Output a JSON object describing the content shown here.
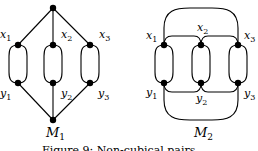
{
  "figure": {
    "graphs": [
      {
        "name": "M",
        "index": "1",
        "vertices": [
          {
            "label": "x",
            "sub": "1"
          },
          {
            "label": "x",
            "sub": "2"
          },
          {
            "label": "x",
            "sub": "3"
          },
          {
            "label": "y",
            "sub": "1"
          },
          {
            "label": "y",
            "sub": "2"
          },
          {
            "label": "y",
            "sub": "3"
          }
        ]
      },
      {
        "name": "M",
        "index": "2",
        "vertices": [
          {
            "label": "x",
            "sub": "1"
          },
          {
            "label": "x",
            "sub": "2"
          },
          {
            "label": "x",
            "sub": "3"
          },
          {
            "label": "y",
            "sub": "1"
          },
          {
            "label": "y",
            "sub": "2"
          },
          {
            "label": "y",
            "sub": "3"
          }
        ]
      }
    ],
    "caption": "Figure 9: Non-cubical pairs"
  },
  "colors": {
    "stroke": "#000000",
    "background": "#ffffff"
  }
}
